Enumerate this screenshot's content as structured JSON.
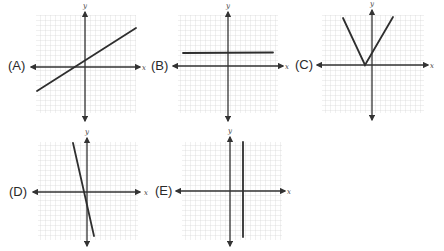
{
  "figure": {
    "axis_labels": {
      "x": "x",
      "y": "y"
    },
    "panels": [
      {
        "id": "A",
        "label": "(A)",
        "graph": "line",
        "description": "Line with positive slope (~1/2), crossing x-axis slightly left of origin, positive y-intercept"
      },
      {
        "id": "B",
        "label": "(B)",
        "graph": "horizontal-line",
        "description": "Horizontal line above the x-axis (y = constant > 0)"
      },
      {
        "id": "C",
        "label": "(C)",
        "graph": "absolute-value",
        "description": "V-shape with vertex on x-axis slightly left of origin, opening upward"
      },
      {
        "id": "D",
        "label": "(D)",
        "graph": "line",
        "description": "Steep line with negative slope, passing near origin"
      },
      {
        "id": "E",
        "label": "(E)",
        "graph": "vertical-line",
        "description": "Vertical line to the right of the y-axis (x = constant > 0)"
      }
    ]
  },
  "colors": {
    "grid": "#d4d4d4",
    "axis": "#333333",
    "curve": "#2e2e2e",
    "label": "#2a2a2a"
  }
}
